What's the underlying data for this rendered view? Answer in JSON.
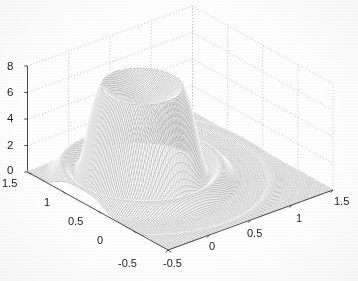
{
  "figure": {
    "kind": "matlab-mesh-3d",
    "background_color": "#ffffff",
    "mesh_color": "#6b6b6b",
    "grid_color": "#b9b9b9",
    "axis_color": "#4a4a4a",
    "label_color": "#1c1c1c"
  },
  "chart_data": {
    "type": "surface",
    "title": "",
    "subtitle": "",
    "xlabel": "",
    "ylabel": "",
    "zlabel": "",
    "grid": true,
    "legend": false,
    "legend_position": "none",
    "projection": "3d-mesh-wireframe",
    "view": {
      "azimuth": -37.5,
      "elevation": 30
    },
    "x": {
      "label": "",
      "ticks": [
        -0.5,
        0,
        0.5,
        1,
        1.5
      ],
      "tick_labels": [
        "-0.5",
        "0",
        "0.5",
        "1",
        "1.5"
      ],
      "lim": [
        -0.5,
        1.5
      ],
      "direction": "bottom-left-to-right"
    },
    "y": {
      "label": "",
      "ticks": [
        -0.5,
        0,
        0.5,
        1,
        1.5
      ],
      "tick_labels": [
        "-0.5",
        "0",
        "0.5",
        "1",
        "1.5"
      ],
      "lim": [
        -0.5,
        1.5
      ],
      "direction": "bottom-right-to-left"
    },
    "z": {
      "label": "",
      "ticks": [
        0,
        2,
        4,
        6,
        8
      ],
      "tick_labels": [
        "0",
        "2",
        "4",
        "6",
        "8"
      ],
      "lim": [
        0,
        8
      ]
    },
    "surface_description": "Single clipped peak (plateau/mesa) rising from a flat baseline plane, with concave saturated top and concentric ripple rings on its flanks",
    "peak": {
      "x": 0.25,
      "y": 0.75,
      "height": 7.0,
      "plateau_top": 7.0,
      "plateau_dish_depth": 1.4
    },
    "baseline": 0.0,
    "grid_resolution": {
      "nx": 120,
      "ny": 120
    }
  },
  "axes": {
    "z_tick_labels": [
      "8",
      "6",
      "4",
      "2",
      "0"
    ],
    "y_tick_labels": [
      "1.5",
      "1",
      "0.5",
      "0",
      "-0.5"
    ],
    "x_tick_labels": [
      "-0.5",
      "0",
      "0.5",
      "1",
      "1.5"
    ]
  }
}
